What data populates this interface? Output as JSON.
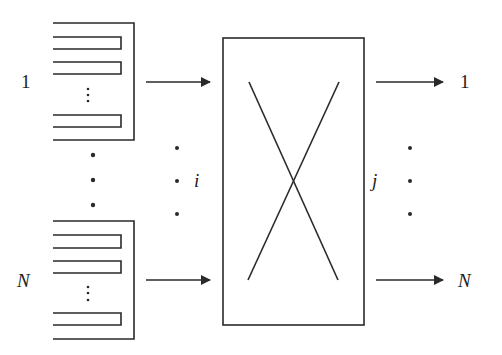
{
  "diagram": {
    "type": "input-queued switch",
    "inputs": {
      "first_label": "1",
      "last_label": "N",
      "index_label": "i"
    },
    "outputs": {
      "first_label": "1",
      "last_label": "N",
      "index_label": "j"
    },
    "switch_fabric": "crossbar (X)",
    "queue_slots_per_input": 3,
    "colors": {
      "stroke": "#2a2a2a",
      "background": "#ffffff"
    }
  }
}
